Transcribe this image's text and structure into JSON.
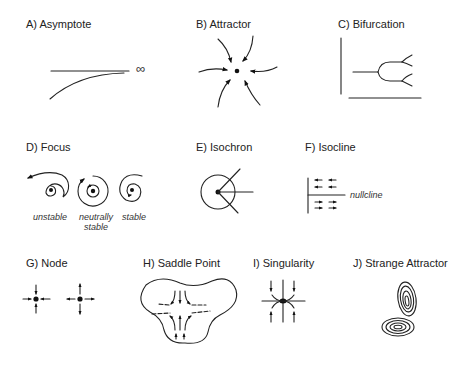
{
  "panels": [
    {
      "id": "A",
      "title": "A) Asymptote",
      "symbol": "∞"
    },
    {
      "id": "B",
      "title": "B) Attractor"
    },
    {
      "id": "C",
      "title": "C) Bifurcation"
    },
    {
      "id": "D",
      "title": "D) Focus",
      "captions": [
        "unstable",
        "neutrally stable",
        "stable"
      ]
    },
    {
      "id": "E",
      "title": "E) Isochron"
    },
    {
      "id": "F",
      "title": "F) Isocline",
      "caption": "nullcline"
    },
    {
      "id": "G",
      "title": "G) Node"
    },
    {
      "id": "H",
      "title": "H) Saddle Point"
    },
    {
      "id": "I",
      "title": "I) Singularity"
    },
    {
      "id": "J",
      "title": "J) Strange Attractor"
    }
  ],
  "colors": {
    "ink": "#222222",
    "background": "#ffffff"
  }
}
